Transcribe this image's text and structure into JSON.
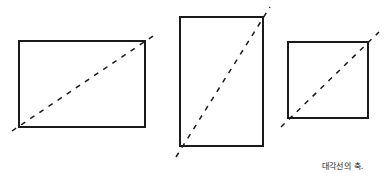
{
  "caption": "대각선의 축.",
  "figures": [
    {
      "name": "horizontal-rectangle",
      "rect": {
        "x": 19,
        "y": 41,
        "w": 126,
        "h": 86
      },
      "diagonal": {
        "x1": 12,
        "y1": 131,
        "x2": 156,
        "y2": 34
      }
    },
    {
      "name": "vertical-rectangle",
      "rect": {
        "x": 180,
        "y": 17,
        "w": 83,
        "h": 129
      },
      "diagonal": {
        "x1": 176,
        "y1": 157,
        "x2": 270,
        "y2": 7
      }
    },
    {
      "name": "square",
      "rect": {
        "x": 288,
        "y": 42,
        "w": 80,
        "h": 76
      },
      "diagonal": {
        "x1": 281,
        "y1": 127,
        "x2": 379,
        "y2": 32
      }
    }
  ],
  "colors": {
    "stroke": "#1a1a1a",
    "background": "#ffffff"
  }
}
